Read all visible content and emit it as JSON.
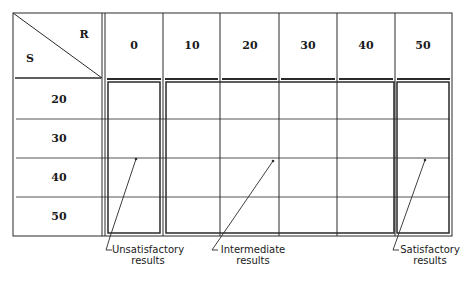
{
  "diagram": {
    "corner": {
      "row_axis_label": "S",
      "column_axis_label": "R"
    },
    "columns": [
      "0",
      "10",
      "20",
      "30",
      "40",
      "50"
    ],
    "rows": [
      "20",
      "30",
      "40",
      "50"
    ],
    "groups": [
      {
        "name": "Unsatisfactory results",
        "line1": "Unsatisfactory",
        "line2": "results",
        "columns": [
          "0"
        ]
      },
      {
        "name": "Intermediate results",
        "line1": "Intermediate",
        "line2": "results",
        "columns": [
          "10",
          "20",
          "30",
          "40"
        ]
      },
      {
        "name": "Satisfactory results",
        "line1": "Satisfactory",
        "line2": "results",
        "columns": [
          "50"
        ]
      }
    ],
    "colors": {
      "line": "#2a2a2a",
      "background": "#ffffff"
    }
  }
}
